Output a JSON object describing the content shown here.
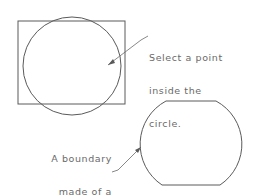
{
  "diagram": {
    "top_annotation": {
      "lines": [
        "Select a point",
        "inside the",
        "circle."
      ]
    },
    "bottom_annotation": {
      "lines": [
        "A boundary",
        "made of a",
        "polyline",
        "is created."
      ]
    },
    "colors": {
      "stroke": "#5a5a5a",
      "text": "#6a6a6a",
      "background": "#ffffff"
    },
    "shapes": {
      "rectangle": {
        "x": 18,
        "y": 21,
        "width": 107,
        "height": 83
      },
      "circle": {
        "cx": 72,
        "cy": 66,
        "r": 49
      },
      "boundary_polyline": "trimmed circle bounded by rectangle"
    }
  }
}
